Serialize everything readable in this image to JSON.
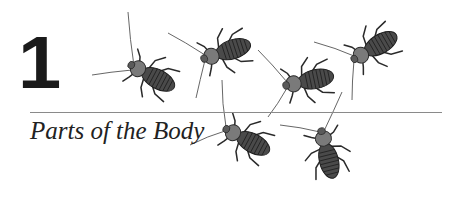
{
  "chapter": {
    "number": "1",
    "title": "Parts of the Body"
  },
  "illustration": {
    "subject": "cockroaches",
    "count": 6,
    "style": "grayscale ink drawing"
  },
  "colors": {
    "text": "#1a1a1a",
    "rule": "#8a8a8a",
    "background": "#ffffff"
  }
}
